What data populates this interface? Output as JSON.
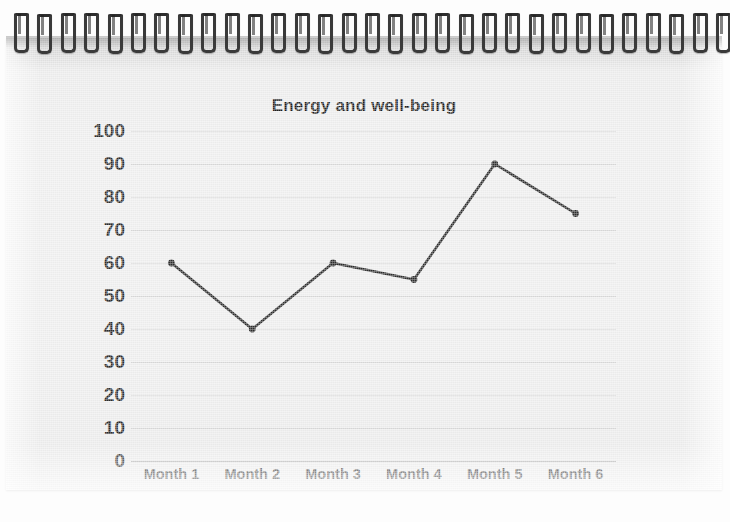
{
  "media": {
    "type": "photo-of-spiral-notebook",
    "binding_ring_count": 31,
    "paper_color": "#ececec"
  },
  "chart_data": {
    "type": "line",
    "title": "Energy and well-being",
    "xlabel": "",
    "ylabel": "",
    "categories": [
      "Month 1",
      "Month 2",
      "Month 3",
      "Month 4",
      "Month 5",
      "Month 6"
    ],
    "values": [
      60,
      40,
      60,
      55,
      90,
      75
    ],
    "series": [
      {
        "name": "Energy and well-being",
        "values": [
          60,
          40,
          60,
          55,
          90,
          75
        ]
      }
    ],
    "ylim": [
      0,
      100
    ],
    "ytick_step": 10,
    "yticks": [
      100,
      90,
      80,
      70,
      60,
      50,
      40,
      30,
      20,
      10,
      0
    ],
    "grid": true,
    "legend": false,
    "legend_position": "none",
    "marker": "circle",
    "line_color": "#2b2b2b",
    "marker_color": "#2b2b2b",
    "gridline_color": "#d8d8d8",
    "axis_color": "#9d9d9d",
    "title_color": "#1d1d1d",
    "tick_label_color": "#2b2b2b"
  }
}
